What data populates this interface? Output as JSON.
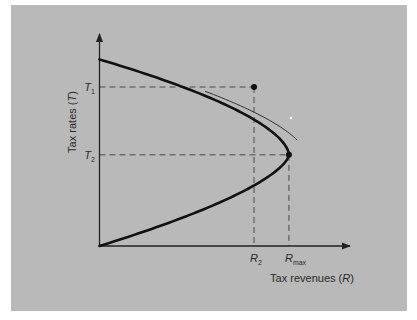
{
  "chart_data": {
    "type": "line",
    "title": "",
    "xlabel": "Tax revenues (R)",
    "ylabel": "Tax rates (T)",
    "xlabel_parts": {
      "text": "Tax revenues (",
      "var": "R",
      "close": ")"
    },
    "ylabel_parts": {
      "text": "Tax rates (",
      "var": "T",
      "close": ")"
    },
    "x_ticks": [
      {
        "label": "R",
        "sub": "2",
        "value": 0.62
      },
      {
        "label": "R",
        "sub": "max",
        "value": 0.76
      }
    ],
    "y_ticks": [
      {
        "label": "T",
        "sub": "1",
        "value": 0.75
      },
      {
        "label": "T",
        "sub": "2",
        "value": 0.43
      }
    ],
    "xlim": [
      0,
      1
    ],
    "ylim": [
      0,
      1
    ],
    "series": [
      {
        "name": "Laffer curve",
        "description": "Revenue rises from zero at T=0, peaks at Rmax at T2, then falls back toward zero as T approaches its maximum (~0.88 of axis height).",
        "peak": {
          "x": 0.76,
          "y": 0.43
        },
        "y_top": 0.88,
        "points": [
          {
            "name": "point-t1-r2",
            "x": 0.62,
            "y": 0.75
          },
          {
            "name": "point-t2-rmax",
            "x": 0.76,
            "y": 0.43
          }
        ]
      }
    ],
    "annotations": [
      "small arc arrow indicating movement from T1 toward T2 along the curve"
    ],
    "grid": false,
    "legend": "none"
  },
  "colors": {
    "background": "#ffffff",
    "panel": "#b9b9b9",
    "curve": "#111111",
    "axis": "#222222",
    "guide": "#4a4a4a"
  }
}
